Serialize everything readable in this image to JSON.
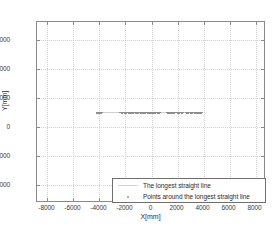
{
  "chart_data": {
    "type": "scatter",
    "title": "",
    "xlabel": "X[mm]",
    "ylabel": "Y[mm]",
    "xlim": [
      -8800,
      8800
    ],
    "ylim": [
      -5200,
      7200
    ],
    "xticks": [
      -8000,
      -6000,
      -4000,
      -2000,
      0,
      2000,
      4000,
      6000,
      8000
    ],
    "xticklabels": [
      "-8000",
      "-6000",
      "-4000",
      "-2000",
      "0",
      "2000",
      "4000",
      "6000",
      "8000"
    ],
    "yticks": [
      -4000,
      -2000,
      0,
      2000,
      4000,
      6000
    ],
    "yticklabels": [
      "-4000",
      "-2000",
      "0",
      "2000",
      "4000",
      "6000"
    ],
    "grid": true,
    "grid_style": "dotted",
    "legend_position": "lower right",
    "series": [
      {
        "name": "The longest straight line",
        "marker": "line",
        "color": "#cfcfcf",
        "x": [
          -4300,
          3900
        ],
        "y": [
          1030,
          1030
        ]
      },
      {
        "name": "Points around the longest straight line",
        "marker": "dot",
        "color": "#8d8d8d",
        "points": [
          [
            -4240,
            1035
          ],
          [
            -4180,
            1040
          ],
          [
            -4120,
            1025
          ],
          [
            -4060,
            1030
          ],
          [
            -4000,
            1038
          ],
          [
            -3940,
            1022
          ],
          [
            -3880,
            1033
          ],
          [
            -2420,
            1048
          ],
          [
            -2360,
            1030
          ],
          [
            -2300,
            1042
          ],
          [
            -2240,
            1026
          ],
          [
            -2180,
            1050
          ],
          [
            -2120,
            1034
          ],
          [
            -2060,
            1020
          ],
          [
            -2000,
            1044
          ],
          [
            -1940,
            1030
          ],
          [
            -1880,
            1052
          ],
          [
            -1820,
            1028
          ],
          [
            -1760,
            1040
          ],
          [
            -1700,
            1022
          ],
          [
            -1640,
            1046
          ],
          [
            -1580,
            1032
          ],
          [
            -1520,
            1018
          ],
          [
            -1460,
            1042
          ],
          [
            -1400,
            1030
          ],
          [
            -1340,
            1050
          ],
          [
            -1280,
            1026
          ],
          [
            -1220,
            1038
          ],
          [
            -1160,
            1020
          ],
          [
            -1100,
            1044
          ],
          [
            -1040,
            1032
          ],
          [
            -980,
            1048
          ],
          [
            -920,
            1024
          ],
          [
            -860,
            1036
          ],
          [
            -800,
            1030
          ],
          [
            -740,
            1046
          ],
          [
            -680,
            1022
          ],
          [
            -620,
            1040
          ],
          [
            -560,
            1034
          ],
          [
            -500,
            1028
          ],
          [
            -440,
            1050
          ],
          [
            -380,
            1026
          ],
          [
            -320,
            1038
          ],
          [
            -260,
            1030
          ],
          [
            -200,
            1044
          ],
          [
            -140,
            1022
          ],
          [
            -80,
            1042
          ],
          [
            -20,
            1032
          ],
          [
            40,
            1028
          ],
          [
            100,
            1046
          ],
          [
            160,
            1024
          ],
          [
            220,
            1036
          ],
          [
            280,
            1030
          ],
          [
            340,
            1048
          ],
          [
            400,
            1026
          ],
          [
            460,
            1040
          ],
          [
            520,
            1034
          ],
          [
            580,
            1030
          ],
          [
            1180,
            1038
          ],
          [
            1240,
            1028
          ],
          [
            1300,
            1044
          ],
          [
            1360,
            1030
          ],
          [
            1420,
            1022
          ],
          [
            1480,
            1040
          ],
          [
            1540,
            1034
          ],
          [
            1600,
            1048
          ],
          [
            1660,
            1026
          ],
          [
            1720,
            1036
          ],
          [
            1960,
            1042
          ],
          [
            2020,
            1030
          ],
          [
            2080,
            1024
          ],
          [
            2140,
            1044
          ],
          [
            2260,
            1032
          ],
          [
            2320,
            1038
          ],
          [
            2380,
            1028
          ],
          [
            2620,
            1046
          ],
          [
            2680,
            1030
          ],
          [
            2740,
            1022
          ],
          [
            2800,
            1040
          ],
          [
            2980,
            1034
          ],
          [
            3040,
            1028
          ],
          [
            3100,
            1044
          ],
          [
            3280,
            1030
          ],
          [
            3340,
            1038
          ],
          [
            3400,
            1024
          ],
          [
            3460,
            1042
          ],
          [
            3580,
            1032
          ],
          [
            3640,
            1036
          ],
          [
            3700,
            1028
          ],
          [
            3760,
            1040
          ],
          [
            3820,
            1030
          ]
        ]
      }
    ]
  },
  "legend": {
    "entries": [
      {
        "label": "The longest straight line"
      },
      {
        "label": "Points around the longest straight line"
      }
    ]
  }
}
